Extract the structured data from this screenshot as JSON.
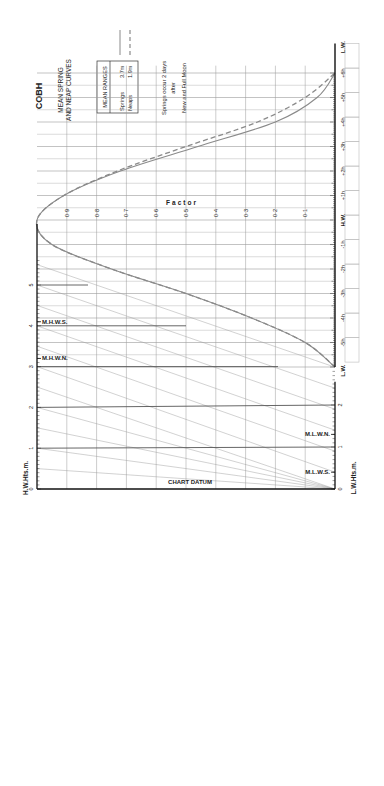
{
  "title": "COBH",
  "subtitle_line1": "MEAN SPRING",
  "subtitle_line2": "AND NEAP CURVES",
  "mean_ranges": {
    "header": "MEAN RANGES",
    "rows": [
      {
        "label": "Springs",
        "value": "3.7m",
        "line": "solid"
      },
      {
        "label": "Neaps",
        "value": "1.9m",
        "line": "dashed"
      }
    ]
  },
  "note": [
    "Springs occur 2 days",
    "after",
    "New and Full Moon"
  ],
  "factor_label": "Factor",
  "hw_axis_label": "H.W.Hts.m.",
  "lw_axis_label": "L.W.Hts.m.",
  "chart_datum_label": "CHART DATUM",
  "hw_markers": [
    {
      "label": "M.H.W.S.",
      "height": 4.1
    },
    {
      "label": "M.H.W.N.",
      "height": 3.2
    }
  ],
  "lw_markers": [
    {
      "label": "M.L.W.N.",
      "height": 1.3
    },
    {
      "label": "M.L.W.S.",
      "height": 0.4
    }
  ],
  "colors": {
    "curve": "#8a8a8a",
    "grid": "#9a9a9a",
    "axis": "#111111",
    "text": "#222222"
  },
  "chart_data": {
    "type": "line",
    "xlabel": "Time relative to H.W. (hours)",
    "ylabel": "Factor",
    "x": [
      -6,
      -5,
      -4,
      -3,
      -2,
      -1,
      0,
      1,
      2,
      3,
      4,
      5,
      6
    ],
    "time_labels": [
      "L.W.",
      "-5h",
      "-4h",
      "-3h",
      "-2h",
      "-1h",
      "H.W.",
      "+1h",
      "+2h",
      "+3h",
      "+4h",
      "+5h",
      "+6h",
      "L.W."
    ],
    "factor_ticks": [
      "0·1",
      "0·2",
      "0·3",
      "0·4",
      "0·5",
      "0·6",
      "0·7",
      "0·8",
      "0·9"
    ],
    "series": [
      {
        "name": "Springs (3.7m)",
        "style": "solid",
        "values": [
          0.0,
          0.1,
          0.28,
          0.5,
          0.75,
          0.95,
          1.0,
          0.91,
          0.72,
          0.46,
          0.2,
          0.06,
          0.0
        ]
      },
      {
        "name": "Neaps (1.9m)",
        "style": "dashed",
        "values": [
          0.0,
          0.1,
          0.28,
          0.5,
          0.75,
          0.95,
          1.0,
          0.91,
          0.73,
          0.5,
          0.26,
          0.1,
          0.0
        ]
      }
    ],
    "hw_height_ticks": [
      0,
      1,
      2,
      3,
      4,
      5
    ],
    "lw_height_ticks": [
      0,
      1,
      2
    ],
    "ylim": [
      0,
      1
    ],
    "xlim": [
      -6,
      6
    ],
    "grid": true,
    "legend_position": "top-left"
  }
}
